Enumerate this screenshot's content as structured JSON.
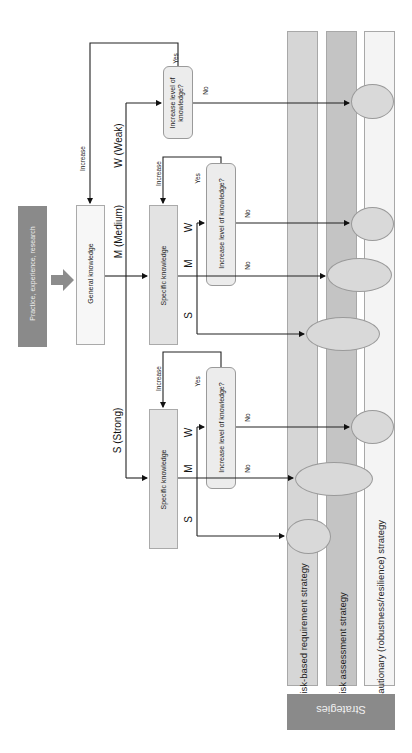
{
  "diagram": {
    "orientation": "rotated-90-clockwise",
    "source": {
      "label": "Practice, experience, research",
      "color": "#8a8a8a"
    },
    "general_knowledge": {
      "label": "General knowledge",
      "increase_label": "Increase"
    },
    "branches": {
      "weak": {
        "label": "W (Weak)"
      },
      "medium": {
        "label": "M (Medium)"
      },
      "strong": {
        "label": "S (Strong)"
      }
    },
    "weak_question": {
      "label": "Increase level of knowledge?",
      "yes": "Yes",
      "no": "No"
    },
    "medium_group": {
      "specific_knowledge": "Specific knowledge",
      "increase_label": "Increase",
      "question": "Increase level of knowledge?",
      "yes": "Yes",
      "no_w": "No",
      "no_m": "No",
      "w": "W",
      "m": "M",
      "s": "S"
    },
    "strong_group": {
      "specific_knowledge": "Specific knowledge",
      "increase_label": "Increase",
      "question": "Increase level of knowledge?",
      "yes": "Yes",
      "no_w": "No",
      "no_m": "No",
      "w": "W",
      "m": "M",
      "s": "S"
    },
    "strategies": {
      "title": "Strategies",
      "title_color": "#8a8a8a",
      "items": [
        {
          "label": "Risk-based requirement strategy",
          "color": "#d6d6d6"
        },
        {
          "label": "Risk assessment strategy",
          "color": "#c4c4c4"
        },
        {
          "label": "Cautionary (robustness/resilience) strategy",
          "color": "#f4f4f4"
        }
      ]
    }
  }
}
